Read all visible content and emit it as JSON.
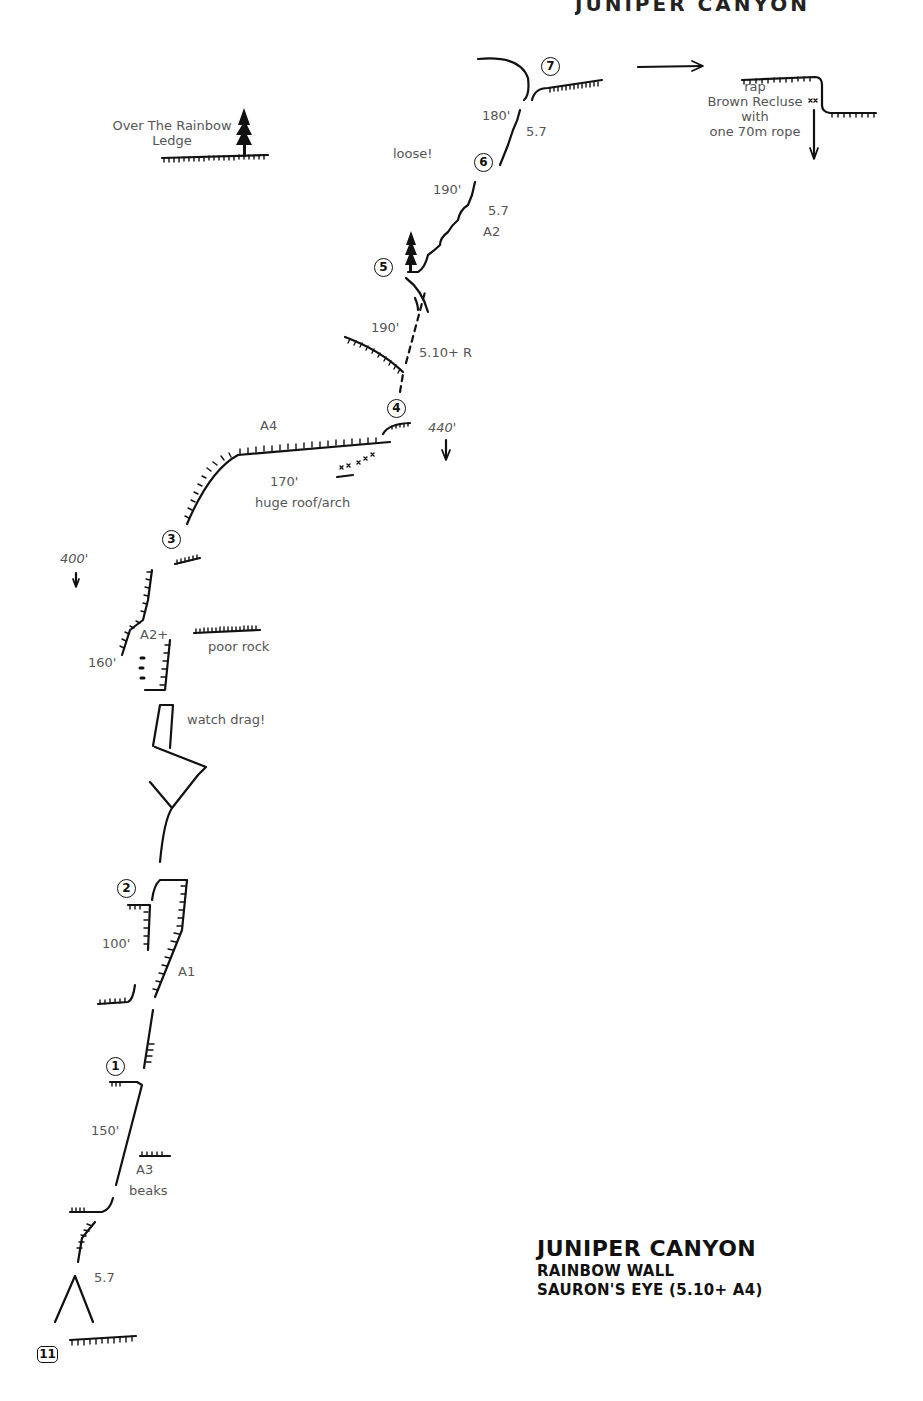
{
  "header_fragment": "JUNIPER CANYON",
  "title": {
    "area": "JUNIPER CANYON",
    "wall": "RAINBOW WALL",
    "route": "SAURON'S EYE (5.10+ A4)"
  },
  "page_number": "11",
  "belays": [
    {
      "id": "1",
      "label": "1"
    },
    {
      "id": "2",
      "label": "2"
    },
    {
      "id": "3",
      "label": "3"
    },
    {
      "id": "4",
      "label": "4"
    },
    {
      "id": "5",
      "label": "5"
    },
    {
      "id": "6",
      "label": "6"
    },
    {
      "id": "7",
      "label": "7"
    }
  ],
  "pitches": [
    {
      "pitch": 1,
      "length": "150'",
      "grade": "A3",
      "note": "beaks",
      "start_grade": "5.7"
    },
    {
      "pitch": 2,
      "length": "100'",
      "grade": "A1"
    },
    {
      "pitch": 3,
      "length": "160'",
      "grade": "A2+",
      "notes": [
        "poor rock",
        "watch drag!"
      ]
    },
    {
      "pitch": 4,
      "length": "170'",
      "grade": "A4",
      "note": "huge roof/arch"
    },
    {
      "pitch": 5,
      "length": "190'",
      "grade": "5.10+ R"
    },
    {
      "pitch": 6,
      "length": "190'",
      "grade": "5.7",
      "aid": "A2",
      "note": "loose!"
    },
    {
      "pitch": 7,
      "length": "180'",
      "grade": "5.7"
    }
  ],
  "labels": {
    "start_grade": "5.7",
    "p1_length": "150'",
    "p1_grade": "A3",
    "p1_note": "beaks",
    "p2_length": "100'",
    "p2_grade": "A1",
    "p3_length": "160'",
    "p3_grade": "A2+",
    "p3_note_rock": "poor rock",
    "p3_note_drag": "watch drag!",
    "height_400": "400'",
    "p4_grade": "A4",
    "p4_length": "170'",
    "p4_note": "huge roof/arch",
    "height_440": "440'",
    "p5_length": "190'",
    "p5_grade": "5.10+ R",
    "p6_length": "190'",
    "p6_grade": "5.7",
    "p6_aid": "A2",
    "p6_note": "loose!",
    "p7_length": "180'",
    "p7_grade": "5.7",
    "ledge_name_1": "Over The Rainbow",
    "ledge_name_2": "Ledge",
    "rap_1": "rap",
    "rap_2": "Brown Recluse",
    "rap_3": "with",
    "rap_4": "one 70m rope"
  },
  "icons": [
    "tree-icon",
    "arrow-right-icon",
    "arrow-down-icon",
    "bolt-anchor-icon"
  ]
}
